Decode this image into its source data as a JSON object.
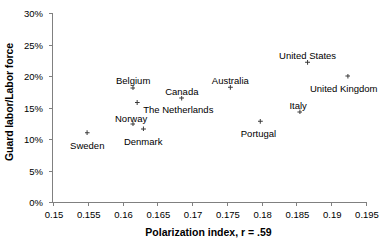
{
  "chart_data": {
    "type": "scatter",
    "title": "",
    "xlabel": "Polarization index, r = .59",
    "ylabel": "Guard labor/Labor force",
    "xlim": [
      0.15,
      0.195
    ],
    "ylim": [
      0,
      30
    ],
    "grid": false,
    "legend": "none",
    "x_ticks": [
      "0.15",
      "0.155",
      "0.16",
      "0.165",
      "0.17",
      "0.175",
      "0.18",
      "0.185",
      "0.19",
      "0.195"
    ],
    "x_tick_values": [
      0.15,
      0.155,
      0.16,
      0.165,
      0.17,
      0.175,
      0.18,
      0.185,
      0.19,
      0.195
    ],
    "y_ticks": [
      "0%",
      "5%",
      "10%",
      "15%",
      "20%",
      "25%",
      "30%"
    ],
    "y_tick_values": [
      0,
      5,
      10,
      15,
      20,
      25,
      30
    ],
    "y_unit": "%",
    "marker_color": "#3a3a3a",
    "axis_color": "#808080",
    "points": [
      {
        "label": "Sweden",
        "x": 0.1549,
        "y": 11.0,
        "label_dx": 0,
        "label_dy": 7
      },
      {
        "label": "Belgium",
        "x": 0.1615,
        "y": 18.1,
        "label_dx": 0,
        "label_dy": -13
      },
      {
        "label": "The Netherlands",
        "x": 0.1621,
        "y": 15.8,
        "label_dx": 6,
        "label_dy": 2
      },
      {
        "label": "Norway",
        "x": 0.1615,
        "y": 12.4,
        "label_dx": -2,
        "label_dy": -11
      },
      {
        "label": "Denmark",
        "x": 0.163,
        "y": 11.6,
        "label_dx": 0,
        "label_dy": 7
      },
      {
        "label": "Canada",
        "x": 0.1685,
        "y": 16.5,
        "label_dx": 0,
        "label_dy": -12
      },
      {
        "label": "Australia",
        "x": 0.1755,
        "y": 18.2,
        "label_dx": 0,
        "label_dy": -12
      },
      {
        "label": "Portugal",
        "x": 0.1798,
        "y": 12.8,
        "label_dx": -2,
        "label_dy": 7
      },
      {
        "label": "Italy",
        "x": 0.1855,
        "y": 14.3,
        "label_dx": -2,
        "label_dy": -12
      },
      {
        "label": "United States",
        "x": 0.1866,
        "y": 22.2,
        "label_dx": 0,
        "label_dy": -12
      },
      {
        "label": "United Kingdom",
        "x": 0.1924,
        "y": 20.0,
        "label_dx": -4,
        "label_dy": 7
      }
    ]
  }
}
